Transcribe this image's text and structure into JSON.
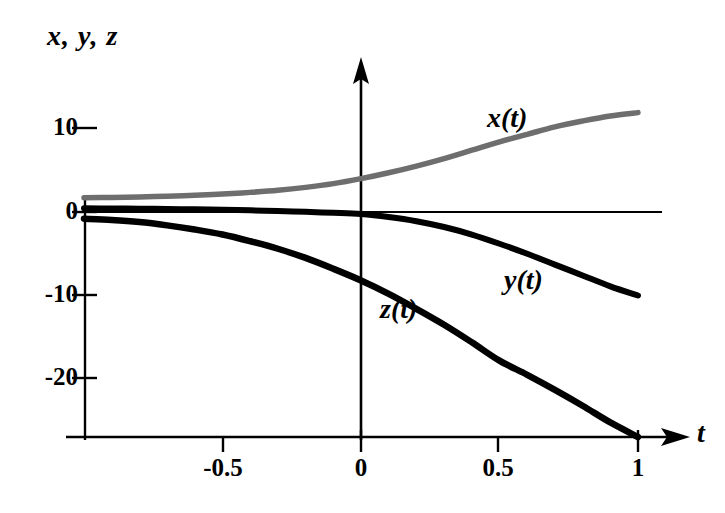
{
  "chart_data": {
    "type": "line",
    "title": "",
    "xlabel": "t",
    "ylabel": "x, y, z",
    "xlim": [
      -1,
      1.2
    ],
    "ylim": [
      -27,
      14
    ],
    "grid": false,
    "legend": "inline-curve-labels",
    "x_ticks": [
      "-0.5",
      "0",
      "0.5",
      "1"
    ],
    "x_tick_values": [
      -0.5,
      0,
      0.5,
      1
    ],
    "y_ticks": [
      "10",
      "0",
      "-10",
      "-20"
    ],
    "y_tick_values": [
      10,
      0,
      -10,
      -20
    ],
    "x": [
      -1,
      -0.9,
      -0.8,
      -0.7,
      -0.6,
      -0.5,
      -0.4,
      -0.3,
      -0.2,
      -0.1,
      0,
      0.1,
      0.2,
      0.3,
      0.4,
      0.5,
      0.6,
      0.7,
      0.8,
      0.9,
      1
    ],
    "series": [
      {
        "name": "x(t)",
        "label": "x(t)",
        "color": "#6e6e6e",
        "values": [
          1.7,
          1.75,
          1.8,
          1.9,
          2.0,
          2.15,
          2.35,
          2.6,
          2.95,
          3.4,
          4.0,
          4.7,
          5.5,
          6.4,
          7.4,
          8.4,
          9.3,
          10.2,
          10.9,
          11.5,
          11.9
        ]
      },
      {
        "name": "y(t)",
        "label": "y(t)",
        "color": "#000000",
        "values": [
          0.45,
          0.42,
          0.4,
          0.36,
          0.32,
          0.27,
          0.2,
          0.12,
          0.02,
          -0.1,
          -0.25,
          -0.6,
          -1.1,
          -1.8,
          -2.7,
          -3.8,
          -5.0,
          -6.3,
          -7.6,
          -8.9,
          -10.0
        ]
      },
      {
        "name": "z(t)",
        "label": "z(t)",
        "color": "#000000",
        "values": [
          -0.8,
          -0.95,
          -1.2,
          -1.6,
          -2.1,
          -2.7,
          -3.5,
          -4.4,
          -5.5,
          -6.8,
          -8.2,
          -9.8,
          -11.6,
          -13.5,
          -15.6,
          -17.8,
          -19.5,
          -21.3,
          -23.2,
          -25.2,
          -27.0
        ]
      }
    ]
  },
  "axes": {
    "y_axis_title": "x, y, z",
    "x_axis_title": "t",
    "y_tick_labels": [
      {
        "text": "10",
        "value": 10
      },
      {
        "text": "0",
        "value": 0
      },
      {
        "text": "-10",
        "value": -10
      },
      {
        "text": "-20",
        "value": -20
      }
    ],
    "x_tick_labels": [
      {
        "text": "-0.5",
        "value": -0.5
      },
      {
        "text": "0",
        "value": 0
      },
      {
        "text": "0.5",
        "value": 0.5
      },
      {
        "text": "1",
        "value": 1
      }
    ]
  },
  "curve_labels": {
    "x": "x(t)",
    "y": "y(t)",
    "z": "z(t)"
  },
  "colors": {
    "x_curve": "#6e6e6e",
    "y_curve": "#000000",
    "z_curve": "#000000",
    "axis": "#000000",
    "background": "#ffffff"
  }
}
